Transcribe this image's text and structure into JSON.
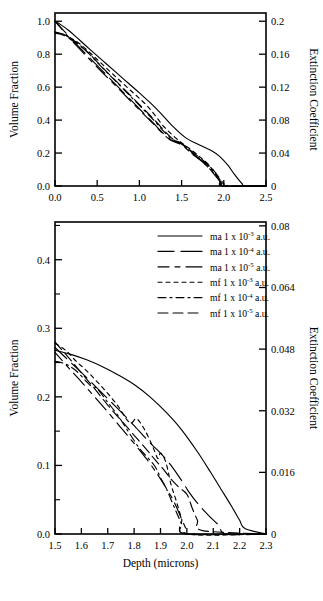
{
  "figure": {
    "title": "",
    "panels": [
      "top-overview-panel",
      "bottom-detail-panel"
    ]
  },
  "legend": {
    "position": "top-right of bottom panel",
    "entries": [
      {
        "label": "ma 1 x 10",
        "exp": "-3",
        "suffix": " a.u.",
        "style": "solid",
        "dash": "none",
        "full": "ma 1 x 10-3 a.u."
      },
      {
        "label": "ma 1 x 10",
        "exp": "-4",
        "suffix": " a.u.",
        "style": "long-dash",
        "dash": "16,7,5,0",
        "full": "ma 1 x 10-4 a.u."
      },
      {
        "label": "ma 1 x 10",
        "exp": "-5",
        "suffix": " a.u.",
        "style": "dash-dash",
        "dash": "11,6,5,6,5,0",
        "full": "ma 1 x 10-5 a.u."
      },
      {
        "label": "mf 1 x 10",
        "exp": "-3",
        "suffix": " a.u.",
        "style": "dotted",
        "dash": "4,4",
        "full": "mf 1 x 10-3 a.u."
      },
      {
        "label": "mf 1 x 10",
        "exp": "-4",
        "suffix": " a.u.",
        "style": "dash-dot",
        "dash": "8,4,2,4",
        "full": "mf 1 x 10-4 a.u."
      },
      {
        "label": "mf 1 x 10",
        "exp": "-5",
        "suffix": " a.u.",
        "style": "long-dash-2",
        "dash": "10,5",
        "full": "mf 1 x 10-5 a.u."
      }
    ]
  },
  "chart_data": [
    {
      "id": "top-panel",
      "type": "line",
      "title": "",
      "xlabel": "",
      "ylabel": "Volume Fraction",
      "y2label": "Extinction Coefficient",
      "xlim": [
        0.0,
        2.5
      ],
      "ylim": [
        0.0,
        1.05
      ],
      "y2lim": [
        0,
        0.21
      ],
      "grid": false,
      "xticks": [
        "0.0",
        "0.5",
        "1.0",
        "1.5",
        "2.0",
        "2.5"
      ],
      "xtick_values": [
        0.0,
        0.5,
        1.0,
        1.5,
        2.0,
        2.5
      ],
      "yticks": [
        "0.0",
        "0.2",
        "0.4",
        "0.6",
        "0.8",
        "1.0"
      ],
      "ytick_values": [
        0.0,
        0.2,
        0.4,
        0.6,
        0.8,
        1.0
      ],
      "y2ticks": [
        "0",
        "0.04",
        "0.08",
        "0.12",
        "0.16",
        "0.2"
      ],
      "y2tick_values": [
        0,
        0.04,
        0.08,
        0.12,
        0.16,
        0.2
      ],
      "series": [
        {
          "name": "ma 1 x 10-3 a.u.",
          "style": "solid",
          "x": [
            0.0,
            0.08,
            0.16,
            0.25,
            0.4,
            0.6,
            0.8,
            1.0,
            1.2,
            1.4,
            1.55,
            1.7,
            1.85,
            1.95,
            2.05,
            2.12,
            2.18,
            2.22,
            2.25,
            2.5
          ],
          "y": [
            1.0,
            0.975,
            0.945,
            0.905,
            0.835,
            0.745,
            0.655,
            0.565,
            0.47,
            0.36,
            0.292,
            0.252,
            0.215,
            0.18,
            0.125,
            0.075,
            0.035,
            0.012,
            0.0,
            0.0
          ]
        },
        {
          "name": "ma 1 x 10-4 a.u.",
          "style": "long-dash",
          "x": [
            0.0,
            0.1,
            0.2,
            0.35,
            0.55,
            0.75,
            0.95,
            1.15,
            1.35,
            1.5,
            1.62,
            1.72,
            1.82,
            1.9,
            1.96,
            2.0,
            2.5
          ],
          "y": [
            1.0,
            0.945,
            0.89,
            0.81,
            0.705,
            0.6,
            0.495,
            0.39,
            0.288,
            0.255,
            0.2,
            0.16,
            0.11,
            0.062,
            0.025,
            0.0,
            0.0
          ]
        },
        {
          "name": "ma 1 x 10-5 a.u.",
          "style": "dash-dash",
          "x": [
            0.0,
            0.1,
            0.2,
            0.35,
            0.55,
            0.75,
            0.95,
            1.15,
            1.35,
            1.5,
            1.62,
            1.74,
            1.84,
            1.92,
            1.97,
            2.0,
            2.5
          ],
          "y": [
            1.0,
            0.94,
            0.882,
            0.8,
            0.695,
            0.592,
            0.488,
            0.385,
            0.285,
            0.25,
            0.196,
            0.15,
            0.1,
            0.055,
            0.02,
            0.0,
            0.0
          ]
        },
        {
          "name": "mf 1 x 10-3 a.u.",
          "style": "dotted",
          "x": [
            0.0,
            0.08,
            0.18,
            0.3,
            0.5,
            0.7,
            0.9,
            1.1,
            1.3,
            1.48,
            1.6,
            1.72,
            1.82,
            1.9,
            1.95,
            2.0,
            2.5
          ],
          "y": [
            0.93,
            0.925,
            0.9,
            0.86,
            0.768,
            0.672,
            0.578,
            0.482,
            0.355,
            0.27,
            0.225,
            0.175,
            0.13,
            0.072,
            0.03,
            0.0,
            0.0
          ]
        },
        {
          "name": "mf 1 x 10-4 a.u.",
          "style": "dash-dot",
          "x": [
            0.0,
            0.1,
            0.22,
            0.36,
            0.56,
            0.76,
            0.96,
            1.16,
            1.36,
            1.5,
            1.62,
            1.74,
            1.85,
            1.93,
            1.98,
            2.0,
            2.5
          ],
          "y": [
            0.935,
            0.92,
            0.885,
            0.825,
            0.718,
            0.615,
            0.51,
            0.405,
            0.295,
            0.258,
            0.205,
            0.158,
            0.105,
            0.055,
            0.018,
            0.0,
            0.0
          ]
        },
        {
          "name": "mf 1 x 10-5 a.u.",
          "style": "long-dash-2",
          "x": [
            0.0,
            0.1,
            0.22,
            0.38,
            0.58,
            0.78,
            0.98,
            1.18,
            1.38,
            1.52,
            1.65,
            1.78,
            1.88,
            1.95,
            2.0,
            2.05,
            2.5
          ],
          "y": [
            0.928,
            0.915,
            0.878,
            0.815,
            0.71,
            0.608,
            0.505,
            0.4,
            0.292,
            0.25,
            0.198,
            0.145,
            0.095,
            0.048,
            0.015,
            0.0,
            0.0
          ]
        }
      ]
    },
    {
      "id": "bottom-panel",
      "type": "line",
      "title": "",
      "xlabel": "Depth (microns)",
      "ylabel": "Volume Fraction",
      "y2label": "Extinction Coefficient",
      "xlim": [
        1.5,
        2.3
      ],
      "ylim": [
        0.0,
        0.455
      ],
      "y2lim": [
        0,
        0.081
      ],
      "grid": false,
      "xticks": [
        "1.5",
        "1.6",
        "1.7",
        "1.8",
        "1.9",
        "2.0",
        "2.1",
        "2.2",
        "2.3"
      ],
      "xtick_values": [
        1.5,
        1.6,
        1.7,
        1.8,
        1.9,
        2.0,
        2.1,
        2.2,
        2.3
      ],
      "yticks": [
        "0.0",
        "0.1",
        "0.2",
        "0.3",
        "0.4"
      ],
      "ytick_values": [
        0.0,
        0.1,
        0.2,
        0.3,
        0.4
      ],
      "yminor_values": [
        0.05,
        0.15,
        0.25,
        0.35,
        0.45
      ],
      "y2ticks": [
        "0",
        "0.016",
        "0.032",
        "0.048",
        "0.064",
        "0.08"
      ],
      "y2tick_values": [
        0,
        0.016,
        0.032,
        0.048,
        0.064,
        0.08
      ],
      "series": [
        {
          "name": "ma 1 x 10-3 a.u.",
          "style": "solid",
          "x": [
            1.5,
            1.56,
            1.62,
            1.68,
            1.74,
            1.8,
            1.86,
            1.92,
            1.98,
            2.04,
            2.09,
            2.13,
            2.17,
            2.2,
            2.22,
            2.3
          ],
          "y": [
            0.268,
            0.262,
            0.254,
            0.244,
            0.232,
            0.218,
            0.2,
            0.178,
            0.152,
            0.12,
            0.09,
            0.065,
            0.04,
            0.02,
            0.008,
            0.0
          ]
        },
        {
          "name": "ma 1 x 10-4 a.u.",
          "style": "long-dash",
          "x": [
            1.5,
            1.56,
            1.62,
            1.68,
            1.74,
            1.8,
            1.86,
            1.9,
            1.94,
            1.98,
            2.01,
            2.04,
            2.08,
            2.12,
            2.15,
            2.3
          ],
          "y": [
            0.272,
            0.25,
            0.228,
            0.205,
            0.182,
            0.158,
            0.133,
            0.118,
            0.1,
            0.078,
            0.06,
            0.045,
            0.028,
            0.013,
            0.0,
            0.0
          ]
        },
        {
          "name": "ma 1 x 10-5 a.u.",
          "style": "dash-dash",
          "x": [
            1.5,
            1.55,
            1.6,
            1.65,
            1.7,
            1.75,
            1.8,
            1.85,
            1.89,
            1.92,
            1.95,
            1.98,
            2.0,
            2.01,
            2.3
          ],
          "y": [
            0.265,
            0.243,
            0.222,
            0.2,
            0.178,
            0.155,
            0.132,
            0.108,
            0.086,
            0.068,
            0.048,
            0.022,
            0.005,
            0.0,
            0.0
          ]
        },
        {
          "name": "mf 1 x 10-3 a.u.",
          "style": "dotted",
          "x": [
            1.5,
            1.54,
            1.58,
            1.62,
            1.66,
            1.7,
            1.74,
            1.77,
            1.79,
            1.81,
            1.84,
            1.87,
            1.89,
            1.9,
            1.92,
            1.94,
            1.96,
            1.98,
            2.0,
            2.3
          ],
          "y": [
            0.278,
            0.268,
            0.252,
            0.238,
            0.222,
            0.205,
            0.186,
            0.168,
            0.162,
            0.168,
            0.152,
            0.128,
            0.11,
            0.118,
            0.105,
            0.072,
            0.048,
            0.022,
            0.0,
            0.0
          ]
        },
        {
          "name": "mf 1 x 10-4 a.u.",
          "style": "dash-dot",
          "x": [
            1.5,
            1.54,
            1.58,
            1.62,
            1.64,
            1.66,
            1.7,
            1.74,
            1.78,
            1.82,
            1.85,
            1.88,
            1.9,
            1.92,
            1.94,
            1.96,
            1.98,
            2.0,
            2.3
          ],
          "y": [
            0.252,
            0.248,
            0.238,
            0.222,
            0.215,
            0.212,
            0.192,
            0.172,
            0.148,
            0.125,
            0.112,
            0.098,
            0.082,
            0.068,
            0.05,
            0.032,
            0.015,
            0.0,
            0.0
          ]
        },
        {
          "name": "mf 1 x 10-5 a.u.",
          "style": "long-dash-2",
          "x": [
            1.5,
            1.55,
            1.6,
            1.65,
            1.7,
            1.75,
            1.8,
            1.85,
            1.88,
            1.91,
            1.94,
            1.97,
            2.0,
            2.02,
            2.04,
            2.06,
            2.3
          ],
          "y": [
            0.28,
            0.258,
            0.235,
            0.212,
            0.188,
            0.166,
            0.144,
            0.122,
            0.108,
            0.095,
            0.08,
            0.068,
            0.058,
            0.038,
            0.02,
            0.005,
            0.0
          ]
        }
      ]
    }
  ]
}
